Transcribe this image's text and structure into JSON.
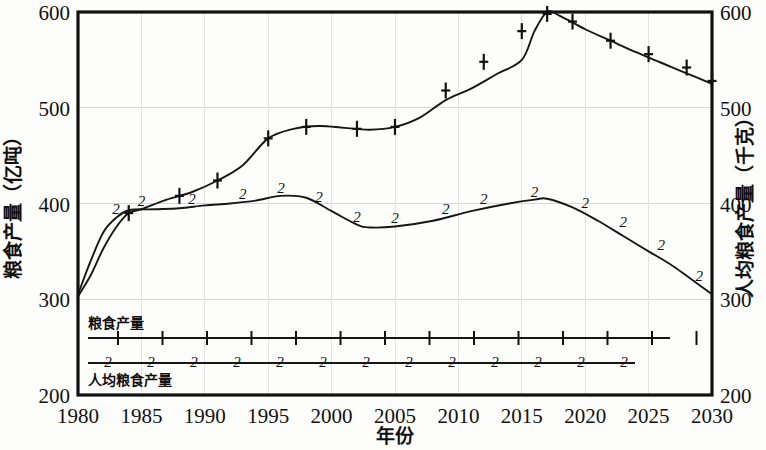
{
  "chart_data": {
    "type": "line",
    "title": "",
    "xlabel": "年份",
    "ylabel": "粮食产量（亿吨）",
    "y2label": "人均粮食产量（千克）",
    "xlim": [
      1980,
      2030
    ],
    "ylim": [
      200,
      600
    ],
    "y2lim": [
      200,
      600
    ],
    "xticks": [
      1980,
      1985,
      1990,
      1995,
      2000,
      2005,
      2010,
      2015,
      2020,
      2025,
      2030
    ],
    "xtick_labels": [
      "1980",
      "1985",
      "1990",
      "1995",
      "2000",
      "2005",
      "2010",
      "2015",
      "2020",
      "2025",
      "2030"
    ],
    "yticks": [
      200,
      300,
      400,
      500,
      600
    ],
    "ytick_labels": [
      "200",
      "300",
      "400",
      "500",
      "600"
    ],
    "y2ticks": [
      200,
      300,
      400,
      500,
      600
    ],
    "y2tick_labels": [
      "200",
      "300",
      "400",
      "500",
      "600"
    ],
    "grid": true,
    "legend_position": "inside-bottom-left",
    "series": [
      {
        "name": "粮食产量",
        "marker": "1",
        "axis": "left",
        "x": [
          1980,
          1981,
          1982,
          1983,
          1984,
          1985,
          1987,
          1989,
          1991,
          1993,
          1995,
          1997,
          1999,
          2001,
          2003,
          2005,
          2007,
          2009,
          2011,
          2013,
          2015,
          2016,
          2017,
          2018,
          2020,
          2022,
          2024,
          2026,
          2028,
          2030
        ],
        "values": [
          303,
          325,
          353,
          375,
          390,
          394,
          404,
          412,
          424,
          440,
          468,
          478,
          481,
          479,
          477,
          480,
          490,
          508,
          520,
          535,
          550,
          580,
          600,
          596,
          582,
          570,
          558,
          547,
          536,
          525
        ],
        "marker_x": [
          1984,
          1988,
          1991,
          1995,
          1998,
          2002,
          2005,
          2009,
          2012,
          2015,
          2017,
          2019,
          2022,
          2025,
          2028,
          2030
        ],
        "marker_values": [
          390,
          408,
          424,
          468,
          480,
          478,
          480,
          518,
          548,
          580,
          598,
          590,
          570,
          556,
          542,
          528
        ]
      },
      {
        "name": "人均粮食产量",
        "marker": "2",
        "axis": "right",
        "x": [
          1980,
          1981,
          1982,
          1983,
          1984,
          1986,
          1988,
          1990,
          1992,
          1994,
          1996,
          1998,
          2000,
          2002,
          2003,
          2005,
          2008,
          2011,
          2014,
          2016,
          2017,
          2019,
          2021,
          2023,
          2025,
          2027,
          2030
        ],
        "values": [
          305,
          340,
          370,
          385,
          393,
          394,
          395,
          398,
          400,
          403,
          408,
          406,
          392,
          378,
          375,
          376,
          382,
          392,
          400,
          404,
          405,
          396,
          382,
          366,
          350,
          334,
          305
        ],
        "marker_x": [
          1983,
          1985,
          1989,
          1993,
          1996,
          1999,
          2002,
          2005,
          2009,
          2012,
          2016,
          2020,
          2023,
          2026,
          2029
        ],
        "marker_values": [
          386,
          394,
          396,
          402,
          408,
          398,
          378,
          376,
          386,
          396,
          404,
          392,
          372,
          348,
          316
        ]
      }
    ]
  },
  "legend": {
    "series1_label": "粮食产量",
    "series2_label": "人均粮食产量",
    "series1_marker": "1",
    "series2_marker": "2"
  }
}
